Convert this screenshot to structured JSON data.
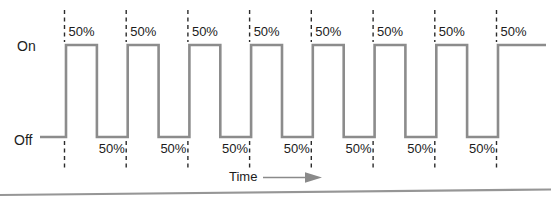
{
  "diagram": {
    "y_axis": {
      "on_label": "On",
      "off_label": "Off"
    },
    "x_axis": {
      "label": "Time"
    },
    "top_duty_labels": [
      "50%",
      "50%",
      "50%",
      "50%",
      "50%",
      "50%",
      "50%",
      "50%"
    ],
    "bottom_duty_labels": [
      "50%",
      "50%",
      "50%",
      "50%",
      "50%",
      "50%",
      "50%"
    ]
  },
  "chart_data": {
    "type": "line",
    "subtype": "square-wave-timing-diagram",
    "title": "",
    "xlabel": "Time",
    "y_levels": [
      "Off",
      "On"
    ],
    "pulse_count": 8,
    "duty_cycle_on": "50%",
    "duty_cycle_off": "50%",
    "sequence": [
      "Off",
      "On",
      "Off",
      "On",
      "Off",
      "On",
      "Off",
      "On",
      "Off",
      "On",
      "Off",
      "On",
      "Off",
      "On",
      "Off",
      "On"
    ],
    "segment_duty_labels_top": [
      "50%",
      "50%",
      "50%",
      "50%",
      "50%",
      "50%",
      "50%",
      "50%"
    ],
    "segment_duty_labels_bottom": [
      "50%",
      "50%",
      "50%",
      "50%",
      "50%",
      "50%",
      "50%"
    ]
  },
  "colors": {
    "wave": "#8c8c8c",
    "dashed_line": "#2b2b2b",
    "text": "#1c1c1c",
    "arrow": "#8a8a8a",
    "bottom_rule": "#969696",
    "background": "#ffffff"
  }
}
